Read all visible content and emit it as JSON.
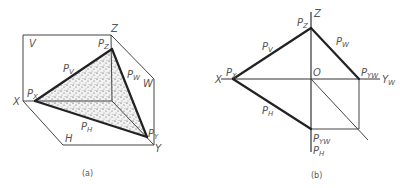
{
  "figure_a": {
    "caption": "(a)",
    "planes": {
      "V": "V",
      "W": "W",
      "H": "H"
    },
    "axes": {
      "X": "X",
      "Y": "Y",
      "Z": "Z"
    },
    "traces": {
      "Pv": "P",
      "Pv_sub": "V",
      "Pw": "P",
      "Pw_sub": "W",
      "Ph": "P",
      "Ph_sub": "H"
    },
    "points": {
      "Px": "P",
      "Px_sub": "X",
      "Py": "P",
      "Py_sub": "Y",
      "Pz": "P",
      "Pz_sub": "Z"
    }
  },
  "figure_b": {
    "caption": "(b)",
    "origin": "O",
    "axes": {
      "X": "X",
      "Z": "Z",
      "Yw": "Y",
      "Yw_sub": "W",
      "Yh": "Y"
    },
    "traces": {
      "Pv": "P",
      "Pv_sub": "V",
      "Pw": "P",
      "Pw_sub": "W",
      "Ph": "P",
      "Ph_sub": "H"
    },
    "points": {
      "Px": "P",
      "Px_sub": "X",
      "Pz": "P",
      "Pz_sub": "Z",
      "Pyw_right": "P",
      "Pyw_right_sub": "YW",
      "Pyw_bottom": "P",
      "Pyw_bottom_sub": "YW",
      "Ph_bottom": "P",
      "Ph_bottom_sub": "H"
    }
  }
}
